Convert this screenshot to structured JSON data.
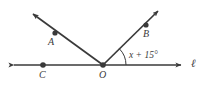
{
  "diagram": {
    "type": "geometry-angle-diagram",
    "background_color": "#ffffff",
    "stroke_color": "#3a3a3a",
    "line_label": "ℓ",
    "angle_expression": "x + 15°",
    "points": [
      {
        "name": "A",
        "label": "A",
        "x": 55,
        "y": 33,
        "label_x": 49,
        "label_y": 36
      },
      {
        "name": "B",
        "label": "B",
        "x": 146,
        "y": 25,
        "label_x": 143,
        "label_y": 28
      },
      {
        "name": "C",
        "label": "C",
        "x": 43,
        "y": 65,
        "label_x": 39,
        "label_y": 68
      },
      {
        "name": "O",
        "label": "O",
        "x": 103,
        "y": 65,
        "label_x": 99,
        "label_y": 68
      }
    ],
    "rays": [
      {
        "name": "ray-OA",
        "from": "O",
        "through": "A",
        "tip_x": 30,
        "tip_y": 12
      },
      {
        "name": "ray-OB",
        "from": "O",
        "through": "B",
        "tip_x": 161,
        "tip_y": 8
      }
    ],
    "line": {
      "name": "line-ell",
      "left_tip_x": 10,
      "right_tip_x": 185,
      "y": 65,
      "label_x": 191,
      "label_y": 58
    },
    "arc": {
      "name": "angle-arc",
      "vertex": "O",
      "radius": 23,
      "between": [
        "ray-OB",
        "line-right-ray"
      ]
    }
  }
}
